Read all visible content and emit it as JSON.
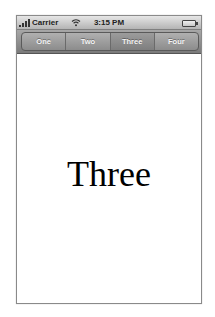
{
  "status_bar": {
    "carrier": "Carrier",
    "time": "3:15 PM",
    "icons": [
      "signal-bars-icon",
      "wifi-icon",
      "battery-icon"
    ]
  },
  "toolbar": {
    "segments": [
      {
        "label": "One",
        "selected": false
      },
      {
        "label": "Two",
        "selected": false
      },
      {
        "label": "Three",
        "selected": true
      },
      {
        "label": "Four",
        "selected": false
      }
    ]
  },
  "content": {
    "label": "Three"
  }
}
